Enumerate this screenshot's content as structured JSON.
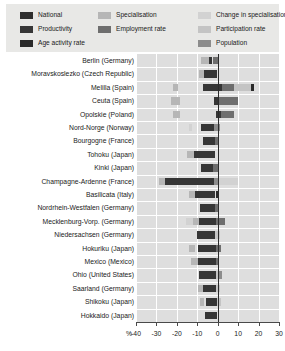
{
  "legend": {
    "items": [
      {
        "label": "National",
        "key": "national",
        "color": "#2e2e2e",
        "col": 1,
        "row": 1
      },
      {
        "label": "Productivity",
        "key": "productivity",
        "color": "#363636",
        "col": 1,
        "row": 2
      },
      {
        "label": "Age activity rate",
        "key": "age_activity",
        "color": "#2a2a2a",
        "col": 1,
        "row": 3
      },
      {
        "label": "Specialisation",
        "key": "specialisation",
        "color": "#b6b6b6",
        "col": 2,
        "row": 1
      },
      {
        "label": "Employment rate",
        "key": "employment",
        "color": "#6e6e6e",
        "col": 2,
        "row": 2
      },
      {
        "label": "Change in specialisation",
        "key": "change_spec",
        "color": "#d2d2d2",
        "col": 3,
        "row": 1
      },
      {
        "label": "Participation rate",
        "key": "participation",
        "color": "#c4c4c4",
        "col": 3,
        "row": 2
      },
      {
        "label": "Population",
        "key": "population",
        "color": "#8c8c8c",
        "col": 3,
        "row": 3
      }
    ]
  },
  "chart_data": {
    "type": "bar",
    "orientation": "horizontal",
    "stacked": true,
    "diverging": true,
    "title": "",
    "xlabel": "%",
    "ylabel": "",
    "xlim": [
      -40,
      30
    ],
    "xticks": [
      -40,
      -30,
      -20,
      -10,
      0,
      10,
      20,
      30
    ],
    "xticklabels": [
      "-40",
      "-30",
      "-20",
      "-10",
      "0",
      "10",
      "20",
      "30"
    ],
    "grid": true,
    "legend_position": "top",
    "axis_unit": "%",
    "series": [
      {
        "name": "Specialisation",
        "key": "specialisation",
        "color": "#b6b6b6"
      },
      {
        "name": "Change in specialisation",
        "key": "change_spec",
        "color": "#d2d2d2"
      },
      {
        "name": "Productivity",
        "key": "productivity",
        "color": "#363636"
      },
      {
        "name": "Employment rate",
        "key": "employment",
        "color": "#6e6e6e"
      },
      {
        "name": "Participation rate",
        "key": "participation",
        "color": "#c4c4c4"
      },
      {
        "name": "Age activity rate",
        "key": "age_activity",
        "color": "#2a2a2a"
      },
      {
        "name": "Population",
        "key": "population",
        "color": "#8c8c8c"
      }
    ],
    "categories": [
      "Berlin (Germany)",
      "Moravskoslezko (Czech Republic)",
      "Melilla  (Spain)",
      "Ceuta (Spain)",
      "Opolskie (Poland)",
      "Nord-Norge (Norway)",
      "Bourgogne (France)",
      "Tohoku (Japan)",
      "Kinki (Japan)",
      "Champagne-Ardenne (France)",
      "Basilicata (Italy)",
      "Nordrhein-Westfalen (Germany)",
      "Mecklenburg-Vorp. (Germany)",
      "Niedersachsen (Germany)",
      "Hokuriku (Japan)",
      "Mexico (Mexico)",
      "Ohio (United States)",
      "Saarland (Germany)",
      "Shikoku (Japan)",
      "Hokkaido (Japan)"
    ],
    "rows": [
      {
        "category": "Berlin (Germany)",
        "segments": [
          {
            "key": "specialisation",
            "from": -8.0,
            "to": -4.5
          },
          {
            "key": "productivity",
            "from": -4.5,
            "to": -3.0
          },
          {
            "key": "employment",
            "from": -2.5,
            "to": 0.0
          }
        ]
      },
      {
        "category": "Moravskoslezko (Czech Republic)",
        "segments": [
          {
            "key": "specialisation",
            "from": -9.0,
            "to": -6.5
          },
          {
            "key": "productivity",
            "from": -6.5,
            "to": -0.5
          }
        ]
      },
      {
        "category": "Melilla  (Spain)",
        "segments": [
          {
            "key": "specialisation",
            "from": -22.0,
            "to": -19.5
          },
          {
            "key": "productivity",
            "from": -7.0,
            "to": 2.0
          },
          {
            "key": "employment",
            "from": 2.0,
            "to": 8.0
          },
          {
            "key": "participation",
            "from": 8.0,
            "to": 16.5
          },
          {
            "key": "age_activity",
            "from": 16.5,
            "to": 18.0
          }
        ]
      },
      {
        "category": "Ceuta (Spain)",
        "segments": [
          {
            "key": "specialisation",
            "from": -23.0,
            "to": -18.5
          },
          {
            "key": "productivity",
            "from": -2.0,
            "to": 0.0
          },
          {
            "key": "employment",
            "from": 0.0,
            "to": 10.0
          }
        ]
      },
      {
        "category": "Opolskie (Poland)",
        "segments": [
          {
            "key": "specialisation",
            "from": -22.0,
            "to": -18.5
          },
          {
            "key": "productivity",
            "from": -1.0,
            "to": 1.5
          },
          {
            "key": "employment",
            "from": 1.5,
            "to": 8.0
          }
        ]
      },
      {
        "category": "Nord-Norge (Norway)",
        "segments": [
          {
            "key": "change_spec",
            "from": -14.0,
            "to": -12.5
          },
          {
            "key": "productivity",
            "from": -8.0,
            "to": -2.0
          },
          {
            "key": "population",
            "from": -2.0,
            "to": 1.0
          }
        ]
      },
      {
        "category": "Bourgogne (France)",
        "segments": [
          {
            "key": "productivity",
            "from": -7.0,
            "to": -1.5
          },
          {
            "key": "employment",
            "from": -1.5,
            "to": 0.0
          }
        ]
      },
      {
        "category": "Tohoku (Japan)",
        "segments": [
          {
            "key": "specialisation",
            "from": -15.0,
            "to": -11.5
          },
          {
            "key": "productivity",
            "from": -11.5,
            "to": -1.5
          }
        ]
      },
      {
        "category": "Kinki (Japan)",
        "segments": [
          {
            "key": "productivity",
            "from": -8.0,
            "to": -2.5
          },
          {
            "key": "employment",
            "from": -2.5,
            "to": 0.0
          }
        ]
      },
      {
        "category": "Champagne-Ardenne (France)",
        "segments": [
          {
            "key": "specialisation",
            "from": -28.5,
            "to": -26.0
          },
          {
            "key": "productivity",
            "from": -26.0,
            "to": -2.0
          },
          {
            "key": "population",
            "from": -2.0,
            "to": 0.5
          },
          {
            "key": "change_spec",
            "from": 0.5,
            "to": 10.0
          }
        ]
      },
      {
        "category": "Basilicata (Italy)",
        "segments": [
          {
            "key": "specialisation",
            "from": -14.0,
            "to": -11.0
          },
          {
            "key": "productivity",
            "from": -11.0,
            "to": -1.5
          },
          {
            "key": "age_activity",
            "from": -1.0,
            "to": 0.5
          }
        ]
      },
      {
        "category": "Nordrhein-Westfalen (Germany)",
        "segments": [
          {
            "key": "productivity",
            "from": -8.5,
            "to": -1.5
          },
          {
            "key": "employment",
            "from": -1.5,
            "to": 0.0
          }
        ]
      },
      {
        "category": "Mecklenburg-Vorp. (Germany)",
        "segments": [
          {
            "key": "change_spec",
            "from": -15.5,
            "to": -12.0
          },
          {
            "key": "specialisation",
            "from": -12.0,
            "to": -9.0
          },
          {
            "key": "productivity",
            "from": -9.0,
            "to": -1.0
          },
          {
            "key": "employment",
            "from": -1.0,
            "to": 3.5
          }
        ]
      },
      {
        "category": "Niedersachsen (Germany)",
        "segments": [
          {
            "key": "productivity",
            "from": -10.0,
            "to": -1.5
          },
          {
            "key": "participation",
            "from": -1.5,
            "to": 1.0
          }
        ]
      },
      {
        "category": "Hokuriku (Japan)",
        "segments": [
          {
            "key": "specialisation",
            "from": -14.0,
            "to": -11.0
          },
          {
            "key": "productivity",
            "from": -9.5,
            "to": -1.0
          },
          {
            "key": "employment",
            "from": -1.0,
            "to": 1.5
          }
        ]
      },
      {
        "category": "Mexico (Mexico)",
        "segments": [
          {
            "key": "specialisation",
            "from": -13.0,
            "to": -9.5
          },
          {
            "key": "productivity",
            "from": -9.5,
            "to": -1.0
          },
          {
            "key": "employment",
            "from": -1.0,
            "to": 0.5
          }
        ]
      },
      {
        "category": "Ohio (United States)",
        "segments": [
          {
            "key": "productivity",
            "from": -9.0,
            "to": -1.0
          },
          {
            "key": "participation",
            "from": -1.0,
            "to": 0.5
          },
          {
            "key": "population",
            "from": 0.5,
            "to": 2.0
          }
        ]
      },
      {
        "category": "Saarland (Germany)",
        "segments": [
          {
            "key": "specialisation",
            "from": -9.5,
            "to": -7.0
          },
          {
            "key": "productivity",
            "from": -7.0,
            "to": -1.0
          },
          {
            "key": "participation",
            "from": -1.0,
            "to": 1.0
          }
        ]
      },
      {
        "category": "Shikoku (Japan)",
        "segments": [
          {
            "key": "specialisation",
            "from": -8.5,
            "to": -6.5
          },
          {
            "key": "productivity",
            "from": -5.5,
            "to": -0.5
          },
          {
            "key": "participation",
            "from": -0.5,
            "to": 1.5
          }
        ]
      },
      {
        "category": "Hokkaido (Japan)",
        "segments": [
          {
            "key": "productivity",
            "from": -6.0,
            "to": -0.5
          }
        ]
      }
    ]
  }
}
